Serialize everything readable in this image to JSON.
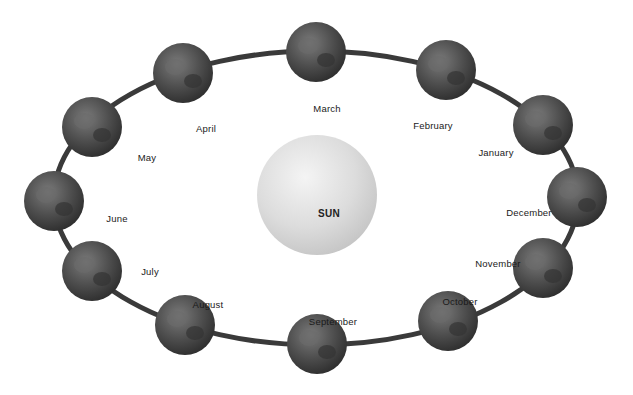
{
  "diagram": {
    "title": "",
    "center": {
      "label": "SUN",
      "cx": 317,
      "cy": 195,
      "r": 60,
      "color": "#d8d8d8"
    },
    "orbit": {
      "cx": 316,
      "cy": 198,
      "rx": 262,
      "ry": 147,
      "stroke": "#3a3a3a",
      "width": 5
    },
    "globe_color": "#4a4a4a",
    "globe_radius": 30,
    "months": [
      {
        "name": "January",
        "globe": [
          543,
          125
        ],
        "label": [
          496,
          152
        ]
      },
      {
        "name": "February",
        "globe": [
          446,
          70
        ],
        "label": [
          433,
          125
        ]
      },
      {
        "name": "March",
        "globe": [
          316,
          52
        ],
        "label": [
          327,
          108
        ]
      },
      {
        "name": "April",
        "globe": [
          183,
          73
        ],
        "label": [
          206,
          128
        ]
      },
      {
        "name": "May",
        "globe": [
          92,
          127
        ],
        "label": [
          147,
          157
        ]
      },
      {
        "name": "June",
        "globe": [
          54,
          201
        ],
        "label": [
          117,
          218
        ]
      },
      {
        "name": "July",
        "globe": [
          92,
          271
        ],
        "label": [
          150,
          271
        ]
      },
      {
        "name": "August",
        "globe": [
          185,
          325
        ],
        "label": [
          208,
          304
        ]
      },
      {
        "name": "September",
        "globe": [
          317,
          344
        ],
        "label": [
          333,
          321
        ]
      },
      {
        "name": "October",
        "globe": [
          448,
          321
        ],
        "label": [
          460,
          301
        ]
      },
      {
        "name": "November",
        "globe": [
          543,
          268
        ],
        "label": [
          498,
          263
        ]
      },
      {
        "name": "December",
        "globe": [
          577,
          197
        ],
        "label": [
          529,
          212
        ]
      }
    ]
  }
}
